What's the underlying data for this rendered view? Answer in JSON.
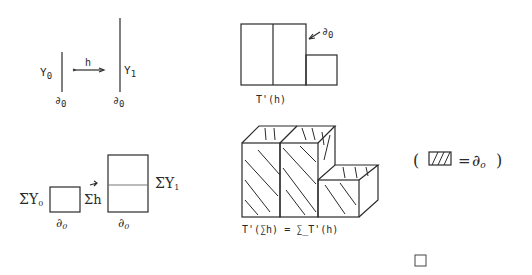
{
  "panel_top_left": {
    "left_label": "Y",
    "left_sub": "0",
    "left_base": "∂",
    "left_base_sub": "0",
    "arrow_label": "h",
    "right_label": "Y",
    "right_sub": "1",
    "right_base": "∂",
    "right_base_sub": "0"
  },
  "panel_top_right": {
    "pointer_label": "∂",
    "pointer_sub": "0",
    "caption": "T'(h)"
  },
  "panel_bottom_left": {
    "left_label": "ΣY",
    "left_sub": "0",
    "left_base": "∂",
    "left_base_sub": "0",
    "arrow_label": "Σh",
    "right_label": "ΣY",
    "right_sub": "1",
    "right_base": "∂",
    "right_base_sub": "0"
  },
  "panel_bottom_right": {
    "caption": "T'(∑h) = ∑_T'(h)"
  },
  "legend": {
    "open_paren": "(",
    "equals": "=",
    "symbol": "∂",
    "symbol_sub": "o",
    "close_paren": ")"
  },
  "end_mark": "□"
}
